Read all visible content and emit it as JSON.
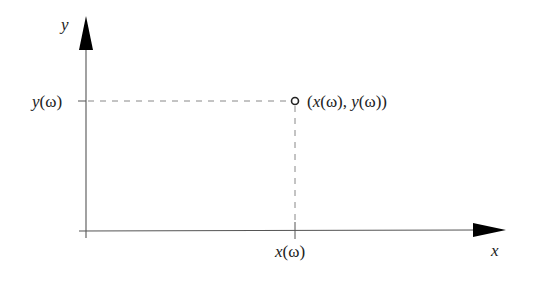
{
  "diagram": {
    "type": "cartesian-point-projection",
    "axes": {
      "x_label": "x",
      "y_label": "y"
    },
    "point": {
      "label": "(x(ω), y(ω))",
      "label_parts": {
        "open": "(",
        "x": "x",
        "x_arg": "(ω)",
        "sep": ", ",
        "y": "y",
        "y_arg": "(ω)",
        "close": ")"
      },
      "marker": "open-circle"
    },
    "x_tick": {
      "label": "x(ω)",
      "var": "x",
      "arg": "(ω)"
    },
    "y_tick": {
      "label": "y(ω)",
      "var": "y",
      "arg": "(ω)"
    },
    "colors": {
      "line": "#444444",
      "arrow": "#000000",
      "dash": "#888888",
      "text": "#222222"
    }
  }
}
